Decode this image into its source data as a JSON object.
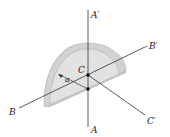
{
  "figure": {
    "type": "3d-axes-diagram",
    "labels": {
      "a_prime": "A′",
      "a": "A",
      "b_prime": "B′",
      "b": "B",
      "c_prime": "C′",
      "c": "C",
      "dimension_a": "a"
    },
    "colors": {
      "plate_face": "#dcdcdc",
      "plate_edge": "#b8b8b8",
      "plate_rim": "#ececec",
      "axis_line": "#333333",
      "point": "#111111"
    }
  }
}
